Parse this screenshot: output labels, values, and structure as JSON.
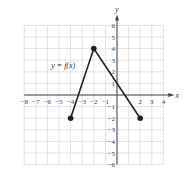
{
  "chart_data": {
    "type": "line",
    "title": "",
    "xlabel": "x",
    "ylabel": "y",
    "xlim": [
      -8,
      4
    ],
    "ylim": [
      -6,
      6
    ],
    "grid": true,
    "x_ticks": [
      -8,
      -7,
      -6,
      -5,
      -4,
      -3,
      -2,
      -1,
      2,
      3,
      4
    ],
    "y_ticks": [
      6,
      5,
      4,
      3,
      2,
      1,
      -1,
      -2,
      -3,
      -4,
      -5,
      -6
    ],
    "series": [
      {
        "name": "y = f(x)",
        "points": [
          [
            -4,
            -2
          ],
          [
            -2,
            4
          ],
          [
            2,
            -2
          ]
        ],
        "color": "#222222"
      }
    ],
    "annotations": [
      {
        "text": "y = f(x)",
        "x": -5.5,
        "y": 2.3
      }
    ],
    "endpoints_filled": [
      [
        -4,
        -2
      ],
      [
        -2,
        4
      ],
      [
        2,
        -2
      ]
    ]
  },
  "labels": {
    "function": "y = f(x)",
    "x_axis": "x",
    "y_axis": "y"
  }
}
